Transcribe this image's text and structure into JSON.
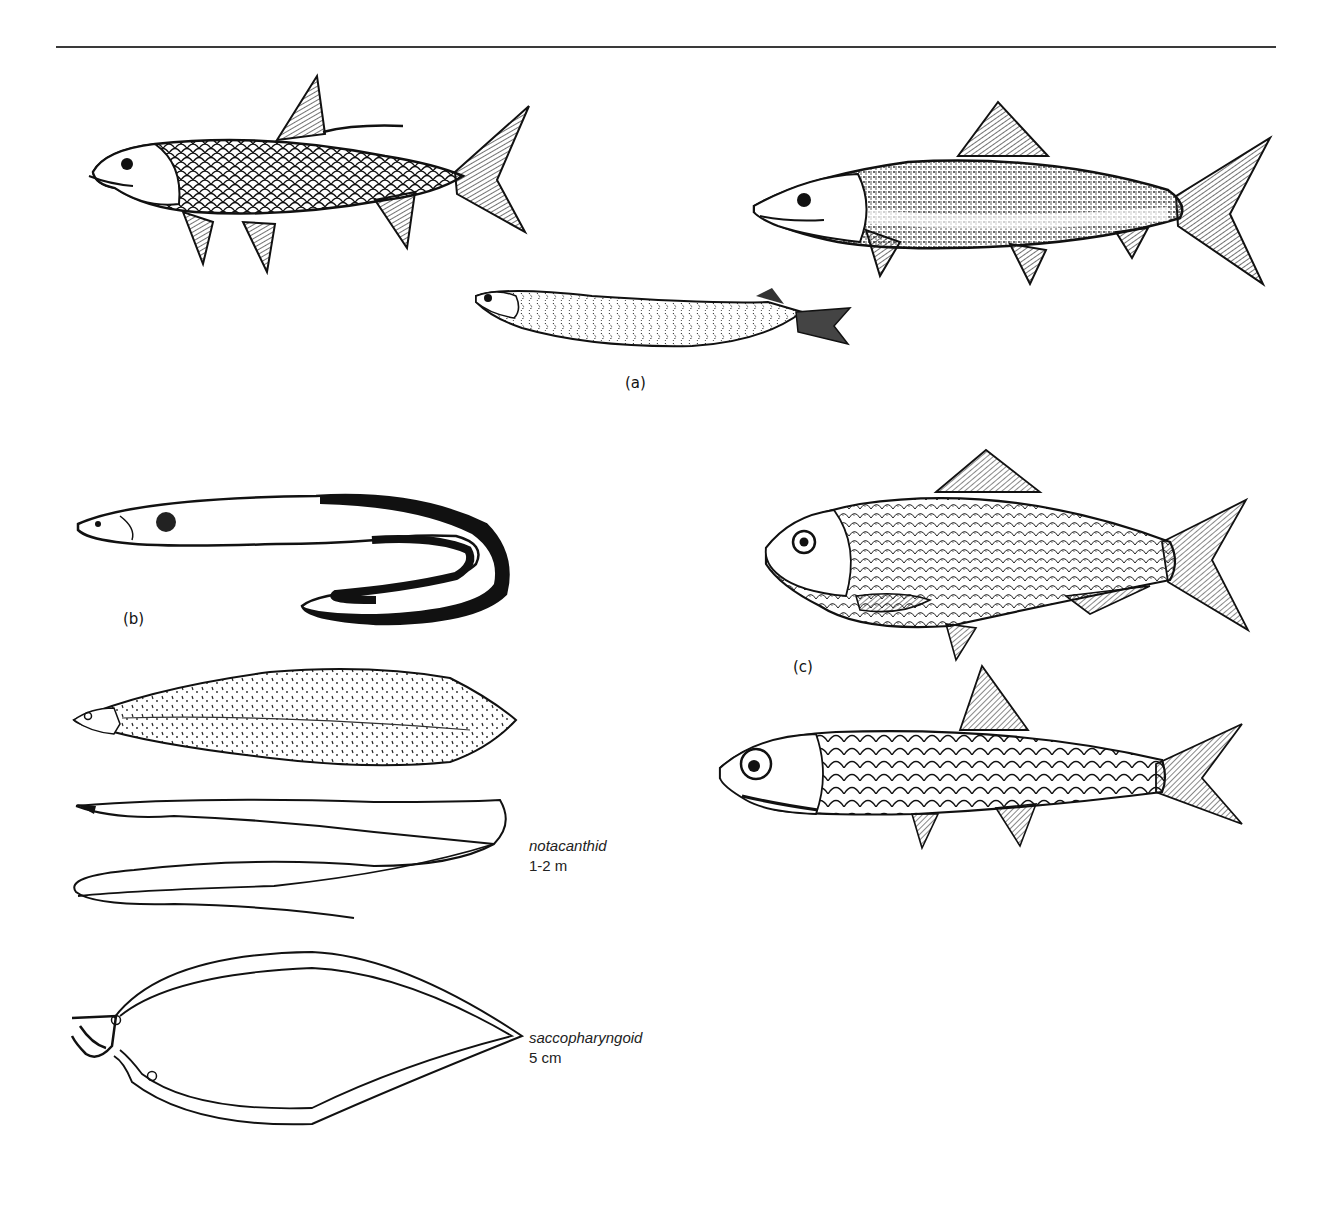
{
  "figure": {
    "panels": [
      {
        "id": "a",
        "label": "(a)",
        "specimens": [
          {
            "name": "tarpon-like fish (large scales, dorsal filament)"
          },
          {
            "name": "bonefish-like fish"
          },
          {
            "name": "leptocephalus-type larva"
          }
        ]
      },
      {
        "id": "b",
        "label": "(b)",
        "specimens": [
          {
            "name": "eel"
          },
          {
            "name": "leptocephalus larva"
          },
          {
            "name": "notacanthid larva",
            "caption_name": "notacanthid",
            "caption_size": "1-2 m"
          },
          {
            "name": "saccopharyngoid larva",
            "caption_name": "saccopharyngoid",
            "caption_size": "5 cm"
          }
        ]
      },
      {
        "id": "c",
        "label": "(c)",
        "specimens": [
          {
            "name": "herring-like fish (clupeid)"
          },
          {
            "name": "anchovy-like fish (engraulid)"
          }
        ]
      }
    ],
    "colors": {
      "ink": "#111111",
      "background": "#ffffff",
      "rule": "#3a3a3a"
    }
  }
}
